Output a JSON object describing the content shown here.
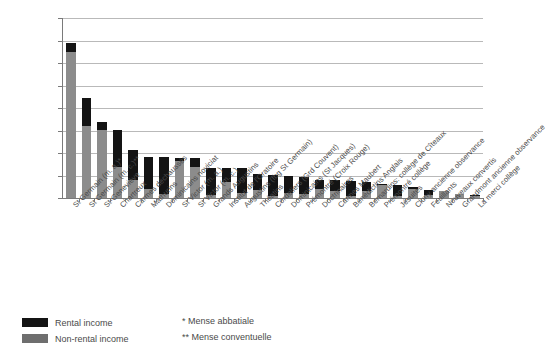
{
  "chart_data": {
    "type": "bar",
    "title": "",
    "subtitle": "",
    "xlabel": "",
    "ylabel": "",
    "stacked": true,
    "grid": true,
    "legend_position": "bottom-left",
    "ylim": [
      0,
      400000
    ],
    "ytick_labels": [
      "400,000",
      "350,000",
      "300,000",
      "250,000",
      "200,000",
      "150,000",
      "100,000",
      "50,000",
      "0"
    ],
    "ytick_values": [
      400000,
      350000,
      300000,
      250000,
      200000,
      150000,
      100000,
      50000,
      0
    ],
    "categories": [
      "St Germain (m. a.)*",
      "St Germain (m. c.)**",
      "St-Geneviève",
      "Chartreux",
      "Carmes déchaussés",
      "Mathurins",
      "Dominicains noviciat",
      "St Victor (m. a.)",
      "St Victor (m. c.)",
      "Grands Augustins",
      "Institut de l'Oratoire",
      "Augustins (fbg St Germain)",
      "Théatins",
      "Cordeliers (Grd Couvent)",
      "Dominicains (St Jacques)",
      "Prémontré (Croix Rouge)",
      "Doctrinaires",
      "Carmes Maubert",
      "Bénédictins Anglais",
      "Bernardins: collège de Cîteaux",
      "Prémontré collège",
      "Jésuites",
      "Cluny ancienne observance",
      "Feuillants",
      "Nouveaux convertis",
      "Grandmont ancienne observance",
      "La merci collège"
    ],
    "series": [
      {
        "name": "Non-rental income",
        "color": "#8c8c8c",
        "values": [
          325000,
          160000,
          152000,
          70000,
          41000,
          21000,
          8000,
          83000,
          70000,
          7000,
          35000,
          11000,
          18000,
          5000,
          12000,
          8000,
          20000,
          15000,
          5000,
          15000,
          28000,
          4000,
          20000,
          6000,
          16000,
          10000,
          4000
        ]
      },
      {
        "name": "Rental income",
        "color": "#141414",
        "values": [
          20000,
          62000,
          16000,
          82000,
          66000,
          70000,
          83000,
          6000,
          20000,
          60000,
          32000,
          56000,
          35000,
          46000,
          36000,
          38000,
          20000,
          24000,
          32000,
          20000,
          4000,
          26000,
          4000,
          12000,
          0,
          0,
          2000
        ]
      }
    ],
    "totals": [
      345000,
      222000,
      168000,
      152000,
      107000,
      91000,
      91000,
      89000,
      90000,
      67000,
      67000,
      67000,
      53000,
      51000,
      48000,
      46000,
      40000,
      39000,
      37000,
      35000,
      32000,
      30000,
      24000,
      18000,
      16000,
      10000,
      6000
    ]
  },
  "legend": {
    "items": [
      {
        "label": "Rental income",
        "color": "#141414"
      },
      {
        "label": "Non-rental income",
        "color": "#6e6e6e"
      }
    ]
  },
  "notes": [
    "* Mense abbatiale",
    "** Mense conventuelle"
  ]
}
